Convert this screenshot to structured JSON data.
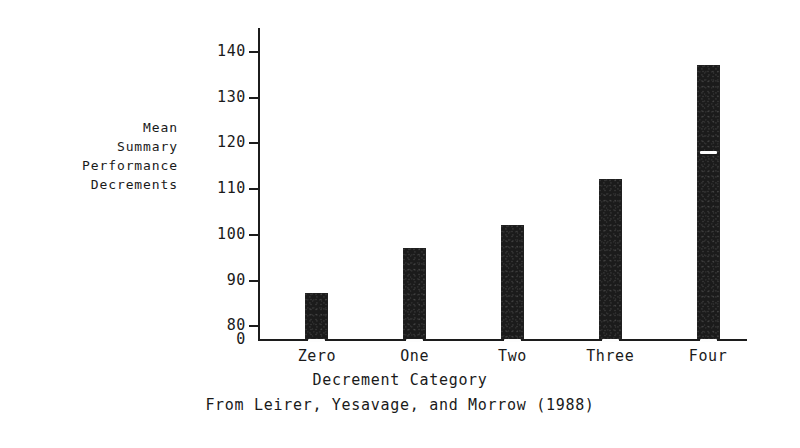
{
  "chart_data": {
    "type": "bar",
    "title": "",
    "subtitle": "",
    "categories": [
      "Zero",
      "One",
      "Two",
      "Three",
      "Four"
    ],
    "values": [
      87,
      97,
      102,
      112,
      137
    ],
    "xlabel": "Decrement Category",
    "ylabel": "Mean Summary Performance Decrements",
    "ylabel_lines": [
      "Mean",
      "Summary",
      "Performance",
      "Decrements"
    ],
    "yticks": [
      80,
      90,
      100,
      110,
      120,
      130,
      140
    ],
    "ytick_labels": [
      "80",
      "90",
      "100",
      "110",
      "120",
      "130",
      "140"
    ],
    "y_origin_label": "0",
    "ylim": [
      77,
      145
    ],
    "axis_broken": true,
    "grid": false,
    "legend": null,
    "caption": "From Leirer, Yesavage, and Morrow (1988)",
    "bar_color": "#1b1b1b",
    "background_color": "#ffffff",
    "annotations": [
      {
        "type": "white-stripe",
        "bar": "Zero",
        "value": 77
      },
      {
        "type": "white-stripe",
        "bar": "One",
        "value": 77
      },
      {
        "type": "white-stripe",
        "bar": "Two",
        "value": 77
      },
      {
        "type": "white-stripe",
        "bar": "Three",
        "value": 77
      },
      {
        "type": "white-stripe",
        "bar": "Four",
        "value": 77
      },
      {
        "type": "white-stripe",
        "bar": "Four",
        "value": 118
      }
    ]
  }
}
